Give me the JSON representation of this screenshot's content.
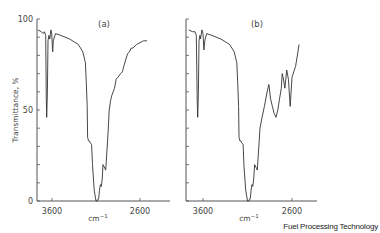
{
  "source_label": "Fuel Processing Technology",
  "chart_data": [
    {
      "type": "line",
      "panel": "(a)",
      "title": "(a)",
      "xlabel": "cm-1",
      "ylabel": "Transmittance, %",
      "x_ticks": [
        "3600",
        "2600"
      ],
      "y_ticks": [
        "0",
        "50",
        "100"
      ],
      "xlim": [
        3750,
        2300
      ],
      "ylim": [
        0,
        100
      ],
      "grid": false,
      "series": [
        {
          "name": "spectrum (a)",
          "x": [
            3760,
            3720,
            3700,
            3685,
            3672,
            3665,
            3660,
            3652,
            3645,
            3635,
            3625,
            3612,
            3603,
            3592,
            3585,
            3560,
            3500,
            3400,
            3300,
            3250,
            3220,
            3210,
            3200,
            3195,
            3185,
            3175,
            3165,
            3150,
            3140,
            3120,
            3100,
            3095,
            3085,
            3078,
            3070,
            3060,
            3050,
            3040,
            3030,
            3020,
            3000,
            2990,
            2975,
            2960,
            2950,
            2935,
            2920,
            2890,
            2870,
            2850,
            2820,
            2800,
            2790,
            2760,
            2740,
            2720,
            2700,
            2680,
            2640,
            2600,
            2560,
            2520
          ],
          "y": [
            94,
            93,
            92,
            93,
            91,
            56,
            46,
            60,
            88,
            91,
            89,
            94,
            92,
            82,
            88,
            92,
            91,
            89,
            86,
            82,
            76,
            65,
            52,
            35,
            33,
            33,
            32,
            31,
            20,
            6,
            0,
            0,
            0,
            1,
            1,
            6,
            9,
            8,
            12,
            20,
            18,
            17,
            28,
            40,
            50,
            55,
            58,
            62,
            67,
            68,
            70,
            71,
            73,
            78,
            81,
            82,
            84,
            84,
            86,
            87,
            88,
            88
          ]
        }
      ]
    },
    {
      "type": "line",
      "panel": "(b)",
      "title": "(b)",
      "xlabel": "cm-1",
      "ylabel": "Transmittance, %",
      "x_ticks": [
        "3600",
        "2600"
      ],
      "y_ticks": [
        "0",
        "50",
        "100"
      ],
      "xlim": [
        3750,
        2300
      ],
      "ylim": [
        0,
        100
      ],
      "grid": false,
      "series": [
        {
          "name": "spectrum (b)",
          "x": [
            3760,
            3720,
            3700,
            3690,
            3675,
            3665,
            3660,
            3652,
            3645,
            3635,
            3628,
            3612,
            3600,
            3590,
            3580,
            3560,
            3500,
            3400,
            3300,
            3250,
            3220,
            3210,
            3200,
            3195,
            3185,
            3175,
            3165,
            3150,
            3140,
            3120,
            3100,
            3095,
            3085,
            3078,
            3070,
            3060,
            3050,
            3040,
            3030,
            3020,
            3000,
            2990,
            2975,
            2960,
            2940,
            2910,
            2880,
            2860,
            2840,
            2820,
            2800,
            2780,
            2760,
            2740,
            2720,
            2710,
            2700,
            2680,
            2660,
            2640,
            2620,
            2600,
            2560,
            2520
          ],
          "y": [
            94,
            93,
            93,
            93,
            91,
            56,
            46,
            60,
            88,
            91,
            89,
            94,
            92,
            83,
            88,
            92,
            91,
            89,
            86,
            82,
            76,
            65,
            52,
            35,
            33,
            33,
            32,
            31,
            20,
            6,
            0,
            0,
            0,
            1,
            1,
            6,
            9,
            8,
            12,
            20,
            18,
            17,
            28,
            40,
            45,
            52,
            60,
            64,
            56,
            52,
            48,
            46,
            50,
            56,
            62,
            70,
            68,
            62,
            72,
            67,
            52,
            68,
            74,
            86
          ]
        }
      ]
    }
  ]
}
